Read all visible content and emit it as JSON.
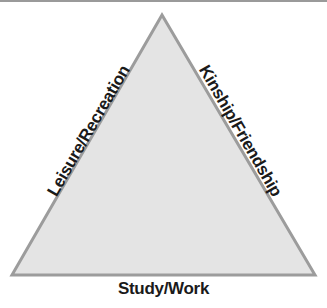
{
  "diagram": {
    "type": "triangle",
    "sides": {
      "left": "Leisure/Recreation",
      "right": "Kinship/Friendship",
      "bottom": "Study/Work"
    },
    "colors": {
      "fill": "#e4e4e4",
      "stroke": "#9c9c9c",
      "text": "#1a1a1a"
    }
  }
}
